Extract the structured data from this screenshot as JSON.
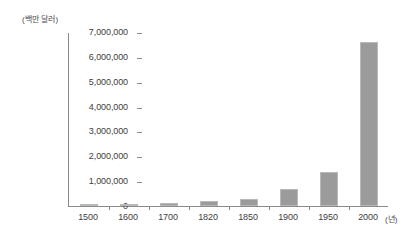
{
  "chart_data": {
    "type": "bar",
    "title": "",
    "subtitle": "",
    "xlabel": "(년)",
    "ylabel": "(백만 달러)",
    "categories": [
      "1500",
      "1600",
      "1700",
      "1820",
      "1850",
      "1900",
      "1950",
      "2000"
    ],
    "values": [
      80000,
      90000,
      110000,
      195000,
      290000,
      680000,
      1350000,
      6600000
    ],
    "series": [
      {
        "name": "",
        "values": [
          80000,
          90000,
          110000,
          195000,
          290000,
          680000,
          1350000,
          6600000
        ]
      }
    ],
    "ylim": [
      0,
      7000000
    ],
    "y_ticks": [
      0,
      1000000,
      2000000,
      3000000,
      4000000,
      5000000,
      6000000,
      7000000
    ],
    "y_tick_labels": [
      "0",
      "1,000,000",
      "2,000,000",
      "3,000,000",
      "4,000,000",
      "5,000,000",
      "6,000,000",
      "7,000,000"
    ],
    "x_tick_labels": [
      "1500",
      "1600",
      "1700",
      "1820",
      "1850",
      "1900",
      "1950",
      "2000"
    ],
    "grid": false,
    "legend": null,
    "legend_position": "none",
    "bar_color": "#9b9b9b",
    "bar_border_color": "#b9b9b9",
    "axis_color": "#8a8a8a",
    "text_color": "#3d3d3d",
    "background_color": "#ffffff",
    "annotations": []
  },
  "axes": {
    "y_unit_caption": "(백만 달러)",
    "x_unit_caption": "(년)"
  }
}
